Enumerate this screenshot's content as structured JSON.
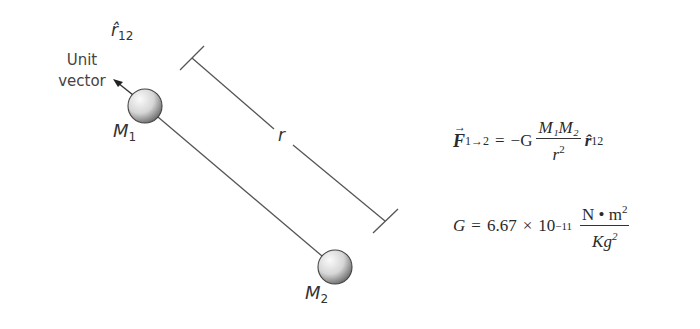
{
  "diagram": {
    "labels": {
      "unit_vector_line1": "Unit",
      "unit_vector_line2": "vector",
      "rhat_symbol": "r̂",
      "rhat_sub": "12",
      "mass1_symbol": "M",
      "mass1_sub": "1",
      "mass2_symbol": "M",
      "mass2_sub": "2",
      "distance_symbol": "r"
    },
    "colors": {
      "line": "#555555",
      "sphere_light": "#f4f4f4",
      "sphere_dark": "#6e6e6e",
      "text": "#333333"
    }
  },
  "equations": {
    "force": {
      "lhs_symbol": "F",
      "lhs_arrow": "→",
      "lhs_sub": "1→2",
      "equals": "=",
      "minus_G": "−G",
      "numerator": "M₁M₂",
      "denominator_base": "r",
      "denominator_exp": "2",
      "unit_vector": "r̂",
      "unit_vector_sub": "12"
    },
    "constant": {
      "lhs": "G",
      "equals": "=",
      "mantissa": "6.67",
      "times": "×",
      "base": "10",
      "exponent": "−11",
      "unit_numerator": "N • m",
      "unit_numerator_exp": "2",
      "unit_denominator": "Kg",
      "unit_denominator_exp": "2"
    }
  }
}
